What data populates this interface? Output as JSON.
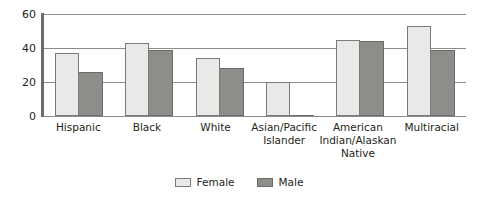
{
  "chart_data": {
    "type": "bar",
    "title": "",
    "subtitle": "",
    "xlabel": "",
    "ylabel": "",
    "ylim": [
      0,
      60
    ],
    "yticks": [
      0,
      20,
      40,
      60
    ],
    "ytick_labels": [
      "0",
      "20",
      "40",
      "60"
    ],
    "grid": true,
    "grid_axis": "y",
    "legend_position": "bottom-center",
    "categories": [
      "Hispanic",
      "Black",
      "White",
      "Asian/Pacific Islander",
      "American Indian/Alaskan Native",
      "Multiracial"
    ],
    "category_label_lines": [
      [
        "Hispanic"
      ],
      [
        "Black"
      ],
      [
        "White"
      ],
      [
        "Asian/Pacific",
        "Islander"
      ],
      [
        "American",
        "Indian/Alaskan",
        "Native"
      ],
      [
        "Multiracial"
      ]
    ],
    "series": [
      {
        "name": "Female",
        "color": "#e9e9e7",
        "border_color": "#7a7a7a",
        "values": [
          37,
          43,
          34,
          20,
          45,
          53
        ]
      },
      {
        "name": "Male",
        "color": "#8d8d8a",
        "border_color": "#6a6a68",
        "values": [
          26,
          39,
          28,
          0,
          44,
          39
        ]
      }
    ]
  },
  "legend": {
    "items": [
      {
        "label": "Female",
        "swatch": "female-swatch"
      },
      {
        "label": "Male",
        "swatch": "male-swatch"
      }
    ]
  },
  "axis": {
    "y_tick_60": "60",
    "y_tick_40": "40",
    "y_tick_20": "20",
    "y_tick_0": "0"
  },
  "colors": {
    "female": "#e9e9e7",
    "male": "#8d8d8a",
    "grid": "#8c8c8c",
    "axis": "#6b6b6b",
    "text": "#231f20",
    "background": "#ffffff"
  }
}
